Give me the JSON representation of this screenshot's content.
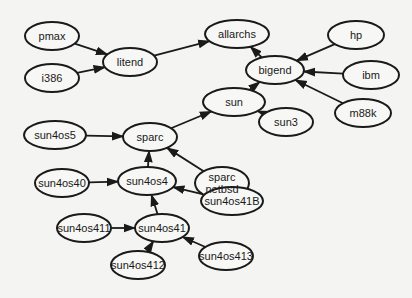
{
  "diagram": {
    "type": "directed-graph",
    "colors": {
      "stroke": "#1a1a1a",
      "background": "#f4f4f2",
      "node_fill": "#f7f7f5"
    },
    "nodes": [
      {
        "id": "pmax",
        "label": "pmax",
        "x": 52,
        "y": 36,
        "rx": 27,
        "ry": 14
      },
      {
        "id": "i386",
        "label": "i386",
        "x": 52,
        "y": 78,
        "rx": 27,
        "ry": 14
      },
      {
        "id": "litend",
        "label": "litend",
        "x": 130,
        "y": 62,
        "rx": 27,
        "ry": 14
      },
      {
        "id": "allarchs",
        "label": "allarchs",
        "x": 237,
        "y": 34,
        "rx": 32,
        "ry": 14
      },
      {
        "id": "hp",
        "label": "hp",
        "x": 356,
        "y": 35,
        "rx": 28,
        "ry": 14
      },
      {
        "id": "bigend",
        "label": "bigend",
        "x": 275,
        "y": 70,
        "rx": 29,
        "ry": 14
      },
      {
        "id": "ibm",
        "label": "ibm",
        "x": 371,
        "y": 75,
        "rx": 28,
        "ry": 14
      },
      {
        "id": "m88k",
        "label": "m88k",
        "x": 363,
        "y": 113,
        "rx": 28,
        "ry": 14
      },
      {
        "id": "sun",
        "label": "sun",
        "x": 234,
        "y": 102,
        "rx": 31,
        "ry": 14
      },
      {
        "id": "sun3",
        "label": "sun3",
        "x": 286,
        "y": 122,
        "rx": 27,
        "ry": 14
      },
      {
        "id": "sun4os5",
        "label": "sun4os5",
        "x": 55,
        "y": 135,
        "rx": 31,
        "ry": 14
      },
      {
        "id": "sparc",
        "label": "sparc",
        "x": 150,
        "y": 137,
        "rx": 27,
        "ry": 14
      },
      {
        "id": "sparc_netbsd",
        "label": "sparc\nnetbsd",
        "x": 222,
        "y": 183,
        "rx": 27,
        "ry": 16
      },
      {
        "id": "sun4os40",
        "label": "sun4os40",
        "x": 62,
        "y": 183,
        "rx": 27,
        "ry": 14
      },
      {
        "id": "sun4os4",
        "label": "sun4os4",
        "x": 147,
        "y": 181,
        "rx": 29,
        "ry": 14
      },
      {
        "id": "sun4os41B",
        "label": "sun4os41B",
        "x": 232,
        "y": 201,
        "rx": 31,
        "ry": 14
      },
      {
        "id": "sun4os411",
        "label": "sun4os411",
        "x": 84,
        "y": 228,
        "rx": 27,
        "ry": 14
      },
      {
        "id": "sun4os41",
        "label": "sun4os41",
        "x": 162,
        "y": 228,
        "rx": 27,
        "ry": 14
      },
      {
        "id": "sun4os412",
        "label": "sun4os412",
        "x": 138,
        "y": 265,
        "rx": 27,
        "ry": 14
      },
      {
        "id": "sun4os413",
        "label": "sun4os413",
        "x": 226,
        "y": 256,
        "rx": 27,
        "ry": 14
      }
    ],
    "edges": [
      {
        "from": "pmax",
        "to": "litend"
      },
      {
        "from": "i386",
        "to": "litend"
      },
      {
        "from": "litend",
        "to": "allarchs"
      },
      {
        "from": "bigend",
        "to": "allarchs"
      },
      {
        "from": "hp",
        "to": "bigend"
      },
      {
        "from": "ibm",
        "to": "bigend"
      },
      {
        "from": "m88k",
        "to": "bigend"
      },
      {
        "from": "sun",
        "to": "bigend"
      },
      {
        "from": "sun3",
        "to": "sun"
      },
      {
        "from": "sparc",
        "to": "sun"
      },
      {
        "from": "sun4os5",
        "to": "sparc"
      },
      {
        "from": "sparc_netbsd",
        "to": "sparc"
      },
      {
        "from": "sun4os4",
        "to": "sparc"
      },
      {
        "from": "sun4os40",
        "to": "sun4os4"
      },
      {
        "from": "sun4os41B",
        "to": "sun4os4"
      },
      {
        "from": "sun4os41",
        "to": "sun4os4"
      },
      {
        "from": "sun4os411",
        "to": "sun4os41"
      },
      {
        "from": "sun4os412",
        "to": "sun4os41"
      },
      {
        "from": "sun4os413",
        "to": "sun4os41"
      }
    ]
  }
}
